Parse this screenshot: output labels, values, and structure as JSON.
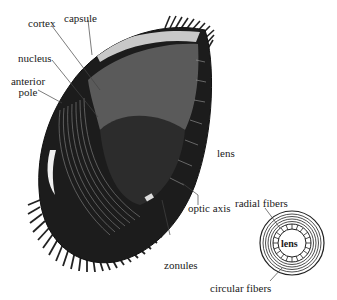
{
  "figure": {
    "labels": {
      "cortex": "cortex",
      "capsule": "capsule",
      "nucleus": "nucleus",
      "anterior_pole_line1": "anterior",
      "anterior_pole_line2": "pole",
      "lens": "lens",
      "optic_axis": "optic axis",
      "zonules": "zonules"
    },
    "inset": {
      "center_label": "lens",
      "radial_fibers": "radial fibers",
      "circular_fibers": "circular fibers"
    },
    "colors": {
      "outer_shell": "#1c1c1c",
      "cortex": "#5a5a5a",
      "nucleus": "#2a2a2a",
      "capsule_band": "#c8c8c8",
      "line": "#333333",
      "background": "#ffffff"
    }
  }
}
